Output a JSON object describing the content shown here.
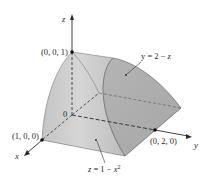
{
  "diagram": {
    "type": "3d-solid-region",
    "axes": {
      "x_label": "x",
      "y_label": "y",
      "z_label": "z",
      "origin_label": "0"
    },
    "points": [
      {
        "label": "(0, 0, 1)"
      },
      {
        "label": "(1, 0, 0)"
      },
      {
        "label": "(0, 2, 0)"
      }
    ],
    "surfaces": [
      {
        "label_prefix": "y = 2 − ",
        "label_var": "z"
      },
      {
        "label_prefix": "z = 1 − ",
        "label_var": "x",
        "label_exp": "2"
      }
    ],
    "colors": {
      "solid_fill": "#b8b8b8",
      "solid_light": "#d2d2d2",
      "solid_face": "#a9a9a9",
      "edge": "#6a6a6a",
      "axis": "#2a2a2a",
      "background": "#ffffff"
    }
  }
}
